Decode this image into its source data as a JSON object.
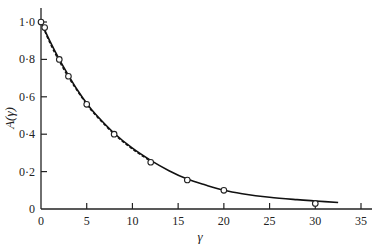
{
  "chart_data": {
    "type": "line",
    "title": "",
    "xlabel": "γ",
    "ylabel": "A(γ)",
    "xlim": [
      0,
      35
    ],
    "ylim": [
      0,
      1.0
    ],
    "grid": false,
    "legend": null,
    "x_ticks": [
      0,
      5,
      10,
      15,
      20,
      25,
      30,
      35
    ],
    "x_tick_labels": [
      "0",
      "5",
      "10",
      "15",
      "20",
      "25",
      "30",
      "35"
    ],
    "y_ticks": [
      0,
      0.2,
      0.4,
      0.6,
      0.8,
      1.0
    ],
    "y_tick_labels": [
      "0",
      "0·2",
      "0·4",
      "0·6",
      "0·8",
      "1·0"
    ],
    "series": [
      {
        "name": "observed",
        "style": "open-circle-markers",
        "x": [
          0,
          0.4,
          2,
          3,
          5,
          8,
          12,
          16,
          20,
          30
        ],
        "y": [
          1.0,
          0.97,
          0.8,
          0.71,
          0.56,
          0.4,
          0.25,
          0.155,
          0.1,
          0.03
        ]
      },
      {
        "name": "fitted-curve",
        "style": "solid-line",
        "x": [
          0,
          1,
          2,
          3,
          4,
          5,
          6,
          8,
          10,
          12,
          14,
          16,
          18,
          20,
          22,
          25,
          28,
          30,
          32.5
        ],
        "y": [
          1.0,
          0.895,
          0.8,
          0.715,
          0.635,
          0.565,
          0.505,
          0.405,
          0.325,
          0.26,
          0.205,
          0.16,
          0.128,
          0.1,
          0.082,
          0.063,
          0.05,
          0.043,
          0.035
        ]
      },
      {
        "name": "alternative-curve",
        "style": "dashed-line",
        "x": [
          0,
          1,
          2,
          3,
          4,
          5,
          6,
          8,
          10,
          12
        ],
        "y": [
          1.0,
          0.885,
          0.79,
          0.705,
          0.63,
          0.56,
          0.5,
          0.4,
          0.32,
          0.255
        ]
      }
    ]
  }
}
